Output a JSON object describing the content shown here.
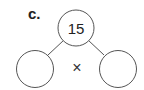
{
  "problem": {
    "label": "c.",
    "top_value": "15",
    "operator": "×",
    "left_value": "",
    "right_value": ""
  },
  "colors": {
    "stroke": "#555555",
    "text": "#222222"
  }
}
